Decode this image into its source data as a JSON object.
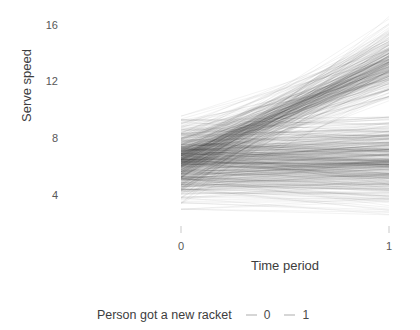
{
  "chart_data": {
    "type": "line",
    "title": "",
    "subtitle": "",
    "xlabel": "Time period",
    "ylabel": "Serve speed",
    "x": [
      0,
      1
    ],
    "x_tick_labels": [
      "0",
      "1"
    ],
    "y_tick_labels": [
      "16",
      "12",
      "8",
      "4"
    ],
    "y_ticks": [
      16,
      12,
      8,
      4
    ],
    "ylim": [
      2.0,
      17.0
    ],
    "xlim": [
      -0.12,
      1.12
    ],
    "grid": false,
    "legend": {
      "position": "bottom",
      "title": "Person got a new racket",
      "entries": [
        {
          "label": "0",
          "color": "#3a3a3a"
        },
        {
          "label": "1",
          "color": "#3a3a3a"
        }
      ]
    },
    "annotations": [],
    "series": [
      {
        "name": "0",
        "group_label": "Person got a new racket = 0",
        "line_color": "#2b2b2b",
        "line_opacity": 0.06,
        "n_lines": 420,
        "t0": {
          "mean": 6.2,
          "sd": 1.25,
          "min": 3.0,
          "max": 9.3
        },
        "t1": {
          "mean": 6.3,
          "sd": 1.45,
          "min": 2.6,
          "max": 9.5
        },
        "slope_mean": 0.1,
        "slope_sd": 0.75
      },
      {
        "name": "1",
        "group_label": "Person got a new racket = 1",
        "line_color": "#2b2b2b",
        "line_opacity": 0.06,
        "n_lines": 300,
        "t0": {
          "mean": 6.6,
          "sd": 1.2,
          "min": 3.4,
          "max": 9.6
        },
        "t1": {
          "mean": 13.3,
          "sd": 1.15,
          "min": 10.4,
          "max": 16.6
        },
        "slope_mean": 6.7,
        "slope_sd": 1.5
      }
    ],
    "clusters": {
      "t0_band": {
        "low": 3.0,
        "high": 9.4
      },
      "t1_upper_band": {
        "low": 10.4,
        "high": 16.6
      },
      "t1_lower_band": {
        "low": 2.6,
        "high": 9.5
      }
    }
  },
  "axis": {
    "y_title": "Serve speed",
    "x_title": "Time period"
  }
}
